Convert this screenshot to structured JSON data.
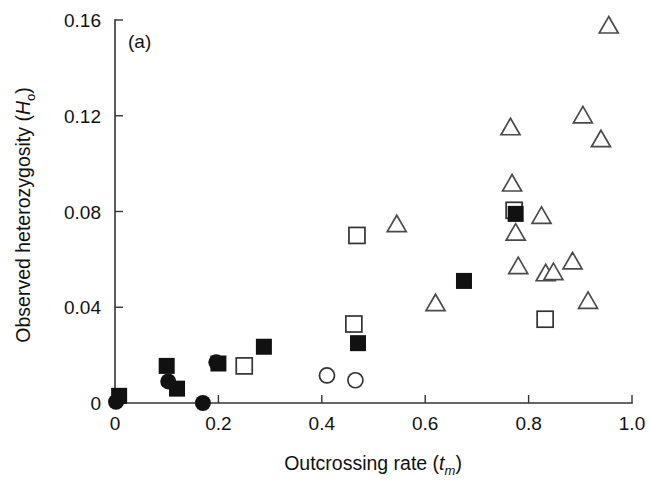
{
  "figure": {
    "panel_label": "(a)",
    "width": 649,
    "height": 487,
    "background": "#ffffff",
    "marker_color": "#111111",
    "axis_color": "#333333"
  },
  "chart_data": {
    "type": "scatter",
    "title": "",
    "panel": "(a)",
    "xlabel": "Outcrossing rate (t_m)",
    "xlabel_main": "Outcrossing rate (",
    "xlabel_italic": "t",
    "xlabel_sub": "m",
    "xlabel_close": ")",
    "ylabel": "Observed heterozygosity (H_o)",
    "ylabel_main": "Observed heterozygosity (",
    "ylabel_italic": "H",
    "ylabel_sub": "o",
    "ylabel_close": ")",
    "xlim": [
      0.0,
      1.0
    ],
    "ylim": [
      0.0,
      0.16
    ],
    "xticks": [
      0.0,
      0.2,
      0.4,
      0.6,
      0.8,
      1.0
    ],
    "xticklabels": [
      "0",
      "0.2",
      "0.4",
      "0.6",
      "0.8",
      "1.0"
    ],
    "yticks": [
      0.0,
      0.04,
      0.08,
      0.12,
      0.16
    ],
    "yticklabels": [
      "0",
      "0.04",
      "0.08",
      "0.12",
      "0.16"
    ],
    "grid": false,
    "legend_position": "none",
    "series": [
      {
        "name": "filled-square",
        "marker": "filled square",
        "points": [
          {
            "x": 0.008,
            "y": 0.003
          },
          {
            "x": 0.1,
            "y": 0.0155
          },
          {
            "x": 0.12,
            "y": 0.006
          },
          {
            "x": 0.2,
            "y": 0.0165
          },
          {
            "x": 0.288,
            "y": 0.0235
          },
          {
            "x": 0.47,
            "y": 0.025
          },
          {
            "x": 0.675,
            "y": 0.051
          },
          {
            "x": 0.775,
            "y": 0.079
          }
        ]
      },
      {
        "name": "filled-circle",
        "marker": "filled circle",
        "points": [
          {
            "x": 0.002,
            "y": 0.0005
          },
          {
            "x": 0.103,
            "y": 0.009
          },
          {
            "x": 0.17,
            "y": 0.0
          },
          {
            "x": 0.196,
            "y": 0.017
          }
        ]
      },
      {
        "name": "open-square",
        "marker": "open square",
        "points": [
          {
            "x": 0.25,
            "y": 0.0155
          },
          {
            "x": 0.468,
            "y": 0.07
          },
          {
            "x": 0.462,
            "y": 0.033
          },
          {
            "x": 0.772,
            "y": 0.0805
          },
          {
            "x": 0.832,
            "y": 0.035
          }
        ]
      },
      {
        "name": "open-circle",
        "marker": "open circle",
        "points": [
          {
            "x": 0.41,
            "y": 0.0115
          },
          {
            "x": 0.465,
            "y": 0.0095
          }
        ]
      },
      {
        "name": "open-triangle",
        "marker": "open triangle",
        "points": [
          {
            "x": 0.545,
            "y": 0.075
          },
          {
            "x": 0.62,
            "y": 0.042
          },
          {
            "x": 0.765,
            "y": 0.1155
          },
          {
            "x": 0.768,
            "y": 0.092
          },
          {
            "x": 0.775,
            "y": 0.0715
          },
          {
            "x": 0.78,
            "y": 0.0575
          },
          {
            "x": 0.825,
            "y": 0.0785
          },
          {
            "x": 0.833,
            "y": 0.0545
          },
          {
            "x": 0.848,
            "y": 0.055
          },
          {
            "x": 0.885,
            "y": 0.0595
          },
          {
            "x": 0.905,
            "y": 0.1205
          },
          {
            "x": 0.915,
            "y": 0.043
          },
          {
            "x": 0.94,
            "y": 0.1105
          },
          {
            "x": 0.955,
            "y": 0.158
          }
        ]
      }
    ]
  }
}
